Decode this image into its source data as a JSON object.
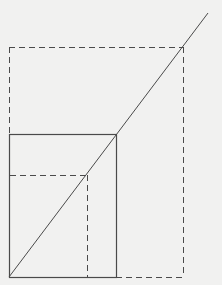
{
  "diagram": {
    "type": "proportional-rectangles-diagonal",
    "colors": {
      "background": "#f1f1f0",
      "stroke": "#4a4a4a"
    },
    "origin": {
      "x": 9,
      "y": 277
    },
    "diagonal": {
      "x1": 9,
      "y1": 277,
      "x2": 208,
      "y2": 13,
      "style": "solid"
    },
    "rectangles": [
      {
        "name": "small-dashed-rect",
        "x": 9,
        "y": 175,
        "width": 78,
        "height": 102,
        "style": "dashed"
      },
      {
        "name": "base-solid-rect",
        "x": 9,
        "y": 134,
        "width": 107,
        "height": 143,
        "style": "solid"
      },
      {
        "name": "large-dashed-rect",
        "x": 9,
        "y": 47,
        "width": 174,
        "height": 230,
        "style": "dashed"
      }
    ]
  }
}
